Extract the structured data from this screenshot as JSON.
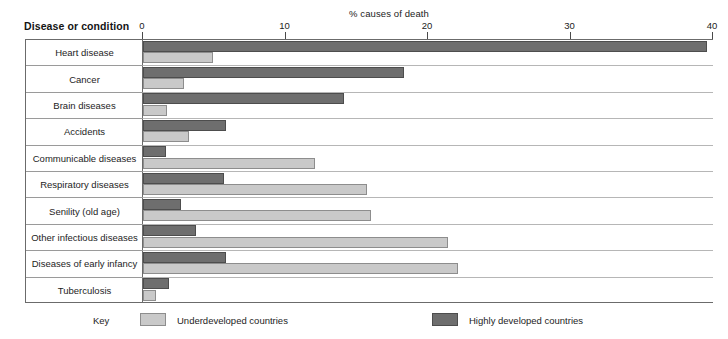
{
  "chart_data": {
    "type": "bar",
    "orientation": "horizontal",
    "title": "",
    "xlabel": "% causes of death",
    "ylabel": "Disease or condition",
    "xlim": [
      0,
      40
    ],
    "xticks": [
      0,
      10,
      20,
      30,
      40
    ],
    "xtick_labels": [
      "0",
      "10",
      "20",
      "30",
      "40"
    ],
    "grid": false,
    "legend_position": "bottom",
    "legend_title": "Key",
    "categories": [
      "Heart disease",
      "Cancer",
      "Brain diseases",
      "Accidents",
      "Communicable diseases",
      "Respiratory diseases",
      "Senility (old age)",
      "Other infectious diseases",
      "Diseases of early infancy",
      "Tuberculosis"
    ],
    "series": [
      {
        "name": "Highly developed countries",
        "color": "#6e6e6e",
        "values": [
          39.6,
          18.3,
          14.1,
          5.8,
          1.6,
          5.7,
          2.7,
          3.7,
          5.8,
          1.8
        ]
      },
      {
        "name": "Underdeveloped countries",
        "color": "#c9c9c9",
        "values": [
          4.9,
          2.9,
          1.7,
          3.2,
          12.1,
          15.7,
          16.0,
          21.4,
          22.1,
          0.9
        ]
      }
    ]
  },
  "legend": {
    "key_label": "Key",
    "entries": [
      {
        "label": "Underdeveloped countries",
        "color": "#c9c9c9"
      },
      {
        "label": "Highly developed countries",
        "color": "#6e6e6e"
      }
    ]
  }
}
